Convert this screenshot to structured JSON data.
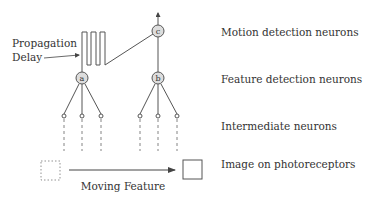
{
  "diagram": {
    "type": "neural-motion-detection-schematic",
    "colors": {
      "stroke": "#555555",
      "node_fill": "#dddddd",
      "text": "#333333",
      "background": "#ffffff"
    },
    "annotations": {
      "propagation_line1": "Propagation",
      "propagation_line2": "Delay",
      "moving_feature": "Moving Feature"
    },
    "layer_labels": {
      "motion": "Motion detection neurons",
      "feature": "Feature detection neurons",
      "intermediate": "Intermediate neurons",
      "image": "Image on photoreceptors"
    },
    "nodes": {
      "a": "a",
      "b": "b",
      "c": "c"
    }
  }
}
